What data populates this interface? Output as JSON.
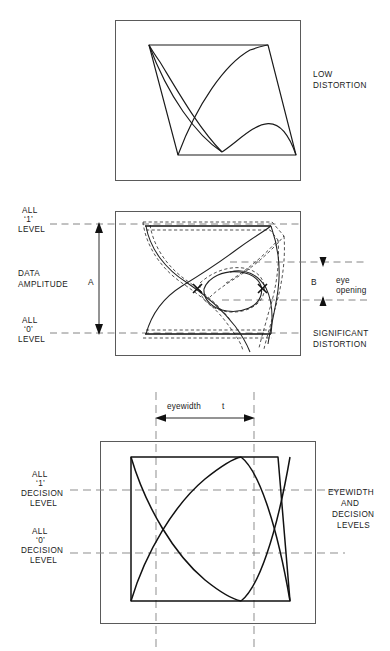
{
  "figure": {
    "type": "technical-diagram",
    "panels": [
      {
        "id": "low-distortion",
        "caption": "LOW\nDISTORTION",
        "caption_lines": [
          "LOW",
          "DISTORTION"
        ],
        "description": "Clean eye diagram with wide open eye"
      },
      {
        "id": "significant-distortion",
        "caption_lines": [
          "SIGNIFICANT",
          "DISTORTION"
        ],
        "left_labels": [
          {
            "lines": [
              "ALL",
              "‘1’",
              "LEVEL"
            ]
          },
          {
            "lines": [
              "DATA",
              "AMPLITUDE"
            ]
          },
          {
            "lines": [
              "ALL",
              "‘0’",
              "LEVEL"
            ]
          }
        ],
        "dimension_a": "A",
        "dimension_b": "B",
        "eye_opening_lines": [
          "eye",
          "opening"
        ]
      },
      {
        "id": "eyewidth-decision-levels",
        "caption_lines": [
          "EYEWIDTH",
          "AND",
          "DECISION",
          "LEVELS"
        ],
        "eyewidth_label": "eyewidth",
        "eyewidth_symbol": "t",
        "left_labels": [
          {
            "lines": [
              "ALL",
              "‘1’",
              "DECISION",
              "LEVEL"
            ]
          },
          {
            "lines": [
              "ALL",
              "‘0’",
              "DECISION",
              "LEVEL"
            ]
          }
        ]
      }
    ]
  },
  "text": {
    "low": "LOW",
    "distortion": "DISTORTION",
    "all": "ALL",
    "one": "‘1’",
    "zero": "‘0’",
    "level": "LEVEL",
    "data": "DATA",
    "amplitude": "AMPLITUDE",
    "A": "A",
    "B": "B",
    "eye": "eye",
    "opening": "opening",
    "significant": "SIGNIFICANT",
    "eyewidth_lc": "eyewidth",
    "t": "t",
    "decision": "DECISION",
    "eyewidth_uc": "EYEWIDTH",
    "and": "AND",
    "decision_uc": "DECISION",
    "levels_uc": "LEVELS"
  },
  "colors": {
    "ink": "#1a1a1a",
    "frame": "#5a5a5a",
    "dashed": "#888888",
    "background": "#ffffff"
  }
}
